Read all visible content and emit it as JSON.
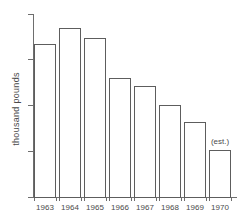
{
  "chart_data": {
    "type": "bar",
    "title": "",
    "subtitle": "",
    "xlabel": "",
    "ylabel": "thousand  pounds",
    "categories": [
      "1963",
      "1964",
      "1965",
      "1966",
      "1967",
      "1968",
      "1969",
      "1970"
    ],
    "values": [
      33.5,
      37.0,
      34.8,
      26.0,
      24.2,
      20.2,
      16.5,
      10.2
    ],
    "series": [
      {
        "name": "thousand pounds",
        "values": [
          33.5,
          37.0,
          34.8,
          26.0,
          24.2,
          20.2,
          16.5,
          10.2
        ]
      }
    ],
    "annotations": [
      {
        "text": "(est.)",
        "category": "1970",
        "value": 10.2
      }
    ],
    "ylim": [
      0,
      40
    ],
    "yticks": [
      0,
      10,
      20,
      30,
      40
    ],
    "ytick_labels": [
      "0",
      "10",
      "20",
      "30",
      "40"
    ],
    "grid": false,
    "legend": false,
    "legend_position": "none",
    "bar_fill_color": "#ffffff",
    "bar_edge_color": "#5d5d5d",
    "axis_color": "#6e6e6e",
    "text_color": "#4a4a4a",
    "background_color": "#ffffff"
  }
}
